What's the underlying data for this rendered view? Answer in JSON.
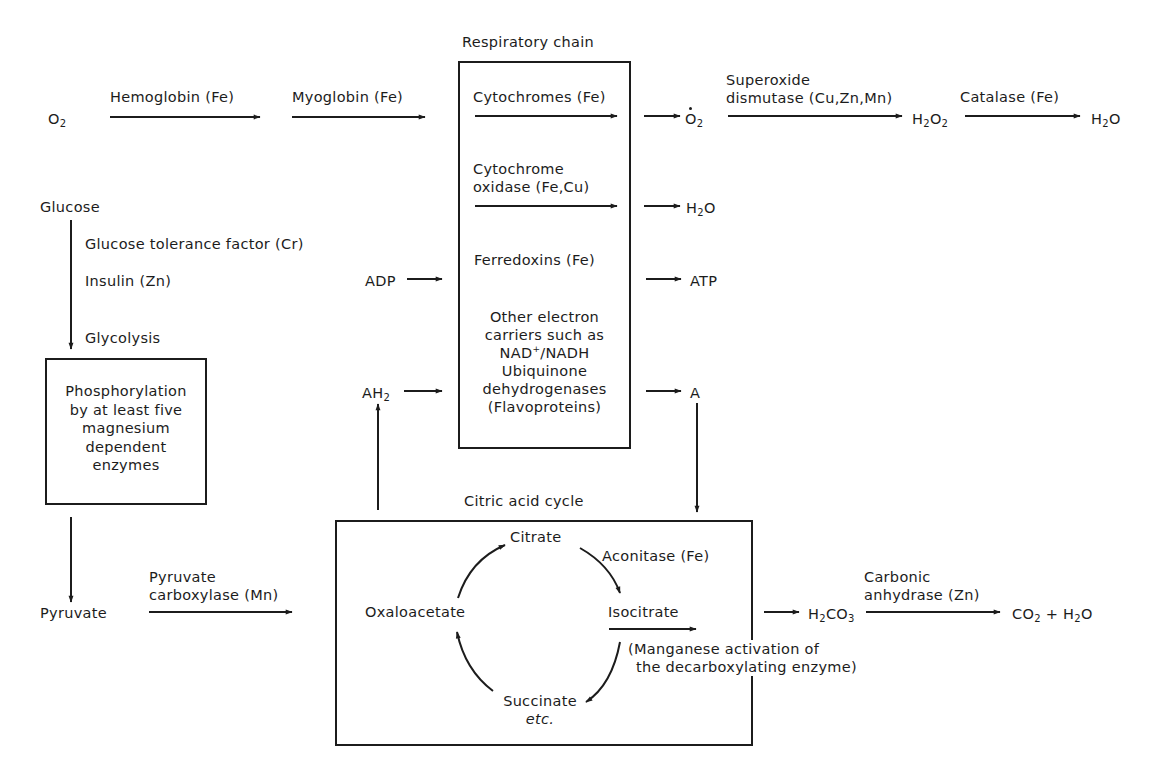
{
  "diagram": {
    "colors": {
      "ink": "#1c1c1c",
      "background": "#ffffff"
    },
    "boxes": {
      "respiratory_chain": {
        "title": "Respiratory chain"
      },
      "glycolysis_box": {
        "lines": [
          "Phosphorylation",
          "by at least five",
          "magnesium",
          "dependent",
          "enzymes"
        ]
      },
      "citric_acid_cycle": {
        "title": "Citric acid cycle"
      }
    },
    "oxygen_path": {
      "start": "O",
      "start_sub": "2",
      "hemoglobin": "Hemoglobin (Fe)",
      "myoglobin": "Myoglobin (Fe)",
      "cytochromes": "Cytochromes (Fe)",
      "superoxide_radical": "O",
      "superoxide_radical_sub": "2",
      "superoxide_dismutase_1": "Superoxide",
      "superoxide_dismutase_2": "dismutase (Cu,Zn,Mn)",
      "h2o2_h": "H",
      "h2o2_sub1": "2",
      "h2o2_o": "O",
      "h2o2_sub2": "2",
      "catalase": "Catalase (Fe)",
      "water_h": "H",
      "water_sub": "2",
      "water_o": "O"
    },
    "respiratory_items": {
      "cytochrome_oxidase_1": "Cytochrome",
      "cytochrome_oxidase_2": "oxidase (Fe,Cu)",
      "ferredoxins": "Ferredoxins (Fe)",
      "other_carriers": [
        "Other electron",
        "carriers such as"
      ],
      "nad_pre": "NAD",
      "nad_sup": "+",
      "nad_post": "/NADH",
      "other_carriers_tail": [
        "Ubiquinone",
        "dehydrogenases",
        "(Flavoproteins)"
      ]
    },
    "outputs": {
      "water_h": "H",
      "water_sub": "2",
      "water_o": "O",
      "atp": "ATP",
      "a": "A"
    },
    "inputs": {
      "adp": "ADP",
      "ah2": "AH",
      "ah2_sub": "2"
    },
    "glucose_path": {
      "glucose": "Glucose",
      "gtf": "Glucose tolerance factor (Cr)",
      "insulin": "Insulin (Zn)",
      "glycolysis": "Glycolysis",
      "pyruvate": "Pyruvate",
      "pyruvate_carboxylase_1": "Pyruvate",
      "pyruvate_carboxylase_2": "carboxylase (Mn)"
    },
    "cycle": {
      "citrate": "Citrate",
      "aconitase": "Aconitase (Fe)",
      "isocitrate": "Isocitrate",
      "oxaloacetate": "Oxaloacetate",
      "succinate": "Succinate",
      "etc": "etc.",
      "manganese_1": "(Manganese activation of",
      "manganese_2": "the decarboxylating enzyme)"
    },
    "carbonic": {
      "h2co3_h": "H",
      "h2co3_sub1": "2",
      "h2co3_co": "CO",
      "h2co3_sub2": "3",
      "enzyme_1": "Carbonic",
      "enzyme_2": "anhydrase (Zn)",
      "co2": "CO",
      "co2_sub": "2",
      "plus": " + ",
      "water_h": "H",
      "water_sub": "2",
      "water_o": "O"
    }
  }
}
